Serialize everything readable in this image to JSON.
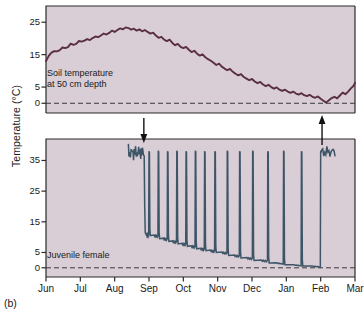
{
  "figure": {
    "panel_label": "(b)",
    "y_axis_title": "Temperature (°C)"
  },
  "chart_data": {
    "type": "line",
    "title": "",
    "xlabel": "",
    "ylabel": "Temperature (°C)",
    "grid": false,
    "legend_position": "none",
    "x_categories": [
      "Jun",
      "Jul",
      "Aug",
      "Sep",
      "Oct",
      "Nov",
      "Dec",
      "Jan",
      "Feb",
      "Mar"
    ],
    "xlim": [
      0,
      9
    ],
    "panels": [
      {
        "name": "soil-temperature-panel",
        "annotation": "Soil temperature\nat 50 cm depth",
        "annotation_line1": "Soil temperature",
        "annotation_line2": "at 50 cm depth",
        "ylim": [
          -3,
          30
        ],
        "y_ticks": [
          0,
          5,
          15,
          25
        ],
        "y_tick_labels": [
          "0",
          "5",
          "15",
          "25"
        ],
        "zero_reference_line": 0,
        "series_name": "Soil temperature at 50 cm depth",
        "series_color": "#5a2f40",
        "x": [
          0.0,
          0.08,
          0.16,
          0.24,
          0.32,
          0.4,
          0.48,
          0.56,
          0.64,
          0.72,
          0.8,
          0.88,
          0.96,
          1.04,
          1.12,
          1.2,
          1.28,
          1.36,
          1.44,
          1.52,
          1.6,
          1.68,
          1.76,
          1.84,
          1.92,
          2.0,
          2.08,
          2.16,
          2.24,
          2.32,
          2.4,
          2.48,
          2.56,
          2.64,
          2.72,
          2.8,
          2.88,
          2.96,
          3.04,
          3.12,
          3.2,
          3.28,
          3.36,
          3.44,
          3.52,
          3.6,
          3.68,
          3.76,
          3.84,
          3.92,
          4.0,
          4.08,
          4.16,
          4.24,
          4.32,
          4.4,
          4.48,
          4.56,
          4.64,
          4.72,
          4.8,
          4.88,
          4.96,
          5.04,
          5.12,
          5.2,
          5.28,
          5.36,
          5.44,
          5.52,
          5.6,
          5.68,
          5.76,
          5.84,
          5.92,
          6.0,
          6.08,
          6.16,
          6.24,
          6.32,
          6.4,
          6.48,
          6.56,
          6.64,
          6.72,
          6.8,
          6.88,
          6.96,
          7.04,
          7.12,
          7.2,
          7.28,
          7.36,
          7.44,
          7.52,
          7.6,
          7.68,
          7.76,
          7.84,
          7.92,
          8.0,
          8.08,
          8.16,
          8.24,
          8.32,
          8.4,
          8.48,
          8.56,
          8.64,
          8.72,
          8.8,
          8.88,
          8.96,
          9.0
        ],
        "y": [
          13.0,
          14.6,
          15.6,
          16.1,
          16.0,
          16.4,
          17.2,
          17.0,
          17.3,
          18.4,
          18.0,
          18.3,
          19.2,
          19.0,
          19.3,
          19.8,
          19.5,
          20.1,
          20.6,
          20.4,
          20.9,
          21.5,
          21.2,
          21.7,
          22.4,
          22.0,
          22.6,
          23.1,
          22.8,
          23.4,
          23.2,
          22.7,
          23.0,
          22.4,
          22.8,
          22.2,
          22.6,
          22.0,
          21.5,
          21.8,
          20.9,
          20.2,
          20.5,
          19.6,
          19.2,
          19.6,
          18.6,
          17.9,
          18.3,
          17.4,
          17.0,
          17.4,
          16.5,
          15.8,
          16.2,
          15.3,
          14.7,
          15.1,
          14.2,
          13.6,
          13.1,
          12.5,
          11.8,
          12.2,
          11.3,
          10.7,
          10.2,
          10.6,
          9.7,
          9.1,
          8.6,
          9.0,
          8.1,
          7.6,
          7.1,
          7.5,
          6.7,
          6.2,
          6.6,
          5.8,
          5.3,
          5.7,
          5.0,
          4.5,
          4.9,
          4.2,
          3.8,
          4.2,
          3.6,
          3.2,
          3.6,
          3.0,
          2.7,
          3.1,
          2.5,
          2.2,
          2.6,
          2.0,
          1.7,
          2.1,
          1.4,
          0.8,
          0.2,
          0.9,
          1.6,
          2.0,
          1.5,
          2.4,
          3.3,
          2.8,
          3.6,
          4.6,
          5.4,
          6.3
        ]
      },
      {
        "name": "body-temperature-panel",
        "annotation": "Juvenile female",
        "ylim": [
          -3,
          42
        ],
        "y_ticks": [
          0,
          5,
          15,
          25,
          35
        ],
        "y_tick_labels": [
          "0",
          "5",
          "15",
          "25",
          "35"
        ],
        "zero_reference_line": 0,
        "series_name": "Juvenile female body temperature",
        "series_color": "#3d5566",
        "arrows": [
          {
            "name": "immergence-arrow",
            "direction": "down",
            "x": 2.85,
            "label": ""
          },
          {
            "name": "emergence-arrow",
            "direction": "up",
            "x": 8.04,
            "label": ""
          }
        ],
        "euthermic_level": 37.0,
        "description": "Juvenile female body temperature: euthermic until immergence (down arrow, late Aug), then hibernation with periodic arousal spikes to ~37-38 °C, torpid minima declining from ~10 °C to ~0.5 °C by February, then emergence (up arrow, early Feb).",
        "arousal_spike_x": [
          3.0,
          3.27,
          3.54,
          3.81,
          4.08,
          4.35,
          4.62,
          4.92,
          5.28,
          5.64,
          6.02,
          6.46,
          6.92,
          7.44,
          8.0
        ],
        "arousal_spike_peak": [
          38.0,
          38.2,
          38.0,
          38.2,
          38.0,
          38.2,
          38.0,
          38.0,
          38.2,
          38.0,
          38.2,
          38.0,
          38.2,
          38.0,
          38.2
        ],
        "torpor_minima_x": [
          3.13,
          3.4,
          3.67,
          3.94,
          4.21,
          4.48,
          4.77,
          5.1,
          5.46,
          5.83,
          6.24,
          6.69,
          7.18,
          7.72
        ],
        "torpor_minima_y": [
          10.5,
          9.5,
          8.6,
          7.8,
          7.0,
          6.2,
          5.6,
          5.0,
          4.0,
          3.2,
          2.4,
          1.6,
          1.0,
          0.6
        ]
      }
    ]
  }
}
